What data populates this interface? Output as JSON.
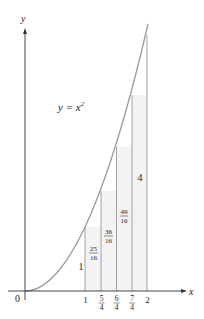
{
  "figure": {
    "function_label": "y = x",
    "function_exponent": "2",
    "axis_labels": {
      "x": "x",
      "y": "y"
    },
    "origin_label": "0",
    "x_ticks": [
      {
        "num": "1",
        "den": ""
      },
      {
        "num": "5",
        "den": "4"
      },
      {
        "num": "6",
        "den": "4"
      },
      {
        "num": "7",
        "den": "4"
      },
      {
        "num": "2",
        "den": ""
      }
    ],
    "rect_heights": [
      {
        "num": "1",
        "den": ""
      },
      {
        "num": "25",
        "den": "16"
      },
      {
        "num": "36",
        "den": "16"
      },
      {
        "num": "49",
        "den": "16"
      },
      {
        "num": "4",
        "den": ""
      }
    ],
    "colors": {
      "axis": "#333333",
      "curve": "#9a9a9a",
      "rect_fill": "#f3f3f3",
      "rect_stroke": "#8a8a8a"
    }
  }
}
